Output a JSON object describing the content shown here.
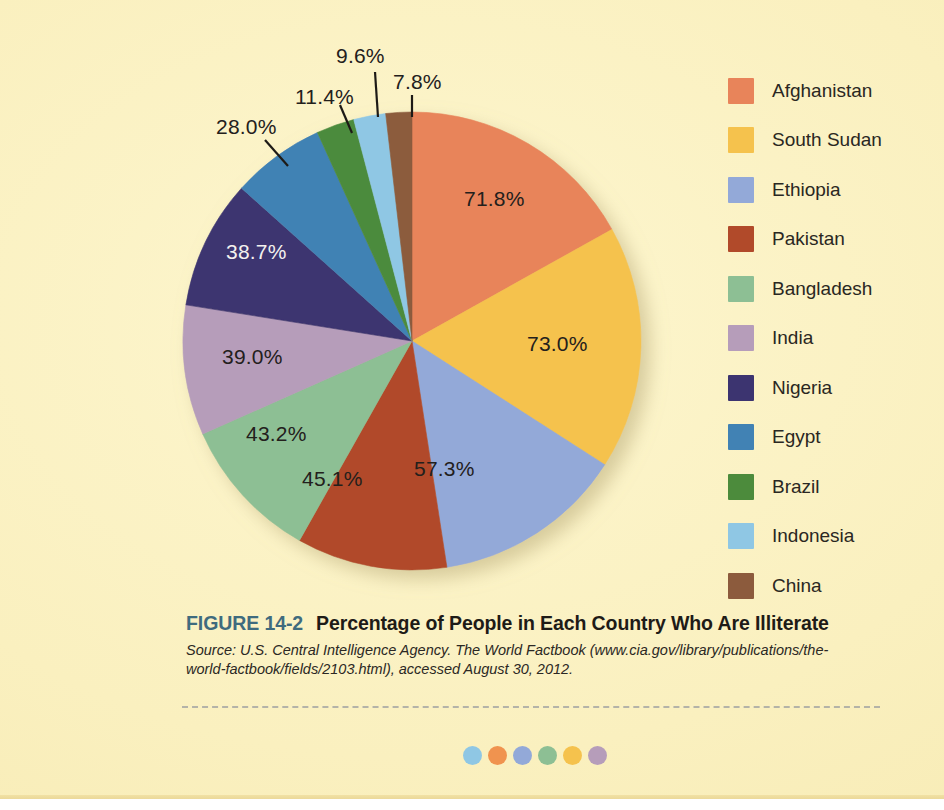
{
  "figure": {
    "number": "FIGURE 14-2",
    "title": "Percentage of People in Each Country Who Are Illiterate",
    "number_color": "#3f6b7e",
    "source": "Source: U.S. Central Intelligence Agency. The World Factbook (www.cia.gov/library/publications/the-world-factbook/fields/2103.html), accessed August 30, 2012."
  },
  "page": {
    "background_color": "#faf0bf"
  },
  "legend": {
    "items": [
      {
        "label": "Afghanistan",
        "color": "#e8845a"
      },
      {
        "label": "South Sudan",
        "color": "#f5c24d"
      },
      {
        "label": "Ethiopia",
        "color": "#93a9d8"
      },
      {
        "label": "Pakistan",
        "color": "#b14a2a"
      },
      {
        "label": "Bangladesh",
        "color": "#8dbf94"
      },
      {
        "label": "India",
        "color": "#b69dba"
      },
      {
        "label": "Nigeria",
        "color": "#3c3470"
      },
      {
        "label": "Egypt",
        "color": "#4182b4"
      },
      {
        "label": "Brazil",
        "color": "#4c8b3c"
      },
      {
        "label": "Indonesia",
        "color": "#8fc7e4"
      },
      {
        "label": "China",
        "color": "#8c5b3d"
      }
    ]
  },
  "chart_data": {
    "type": "pie",
    "title": "Percentage of People in Each Country Who Are Illiterate",
    "xlabel": "",
    "ylabel": "",
    "legend_position": "right",
    "grid": false,
    "note": "Slice angles are proportional to each country's illiteracy percentage; values are percentages of that country's population, not shares of a whole.",
    "categories": [
      "Afghanistan",
      "South Sudan",
      "Ethiopia",
      "Pakistan",
      "Bangladesh",
      "India",
      "Nigeria",
      "Egypt",
      "Brazil",
      "Indonesia",
      "China"
    ],
    "values": [
      71.8,
      73.0,
      57.3,
      45.1,
      43.2,
      39.0,
      38.7,
      28.0,
      11.4,
      9.6,
      7.8
    ],
    "colors": [
      "#e8845a",
      "#f5c24d",
      "#93a9d8",
      "#b14a2a",
      "#8dbf94",
      "#b69dba",
      "#3c3470",
      "#4182b4",
      "#4c8b3c",
      "#8fc7e4",
      "#8c5b3d"
    ],
    "data_labels": [
      "71.8%",
      "73.0%",
      "57.3%",
      "45.1%",
      "43.2%",
      "39.0%",
      "38.7%",
      "28.0%",
      "11.4%",
      "9.6%",
      "7.8%"
    ],
    "total": 424.9
  },
  "slice_labels": [
    {
      "text": "71.8%",
      "placement": "inside",
      "color": "dark"
    },
    {
      "text": "73.0%",
      "placement": "inside",
      "color": "dark"
    },
    {
      "text": "57.3%",
      "placement": "inside",
      "color": "dark"
    },
    {
      "text": "45.1%",
      "placement": "inside",
      "color": "dark"
    },
    {
      "text": "43.2%",
      "placement": "inside",
      "color": "dark"
    },
    {
      "text": "39.0%",
      "placement": "inside",
      "color": "dark"
    },
    {
      "text": "38.7%",
      "placement": "inside",
      "color": "light"
    },
    {
      "text": "28.0%",
      "placement": "outside",
      "color": "dark"
    },
    {
      "text": "11.4%",
      "placement": "outside",
      "color": "dark"
    },
    {
      "text": "9.6%",
      "placement": "outside",
      "color": "dark"
    },
    {
      "text": "7.8%",
      "placement": "outside",
      "color": "dark"
    }
  ],
  "decoration": {
    "dots": [
      "#8fc7e4",
      "#f0934f",
      "#93a9d8",
      "#8dbf94",
      "#f5c24d",
      "#b69dba"
    ]
  }
}
